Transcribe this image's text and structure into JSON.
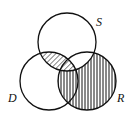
{
  "diagram": {
    "type": "venn",
    "sets": [
      {
        "id": "S",
        "label": "S",
        "cx": 67,
        "cy": 42,
        "r": 29,
        "label_x": 96,
        "label_y": 16
      },
      {
        "id": "D",
        "label": "D",
        "cx": 49,
        "cy": 81,
        "r": 29,
        "label_x": 8,
        "label_y": 92
      },
      {
        "id": "R",
        "label": "R",
        "cx": 87,
        "cy": 81,
        "r": 29,
        "label_x": 117,
        "label_y": 92
      }
    ],
    "shading": [
      {
        "region": "S ∩ D",
        "pattern": "diagonal-hatch"
      },
      {
        "region": "R − (S ∩ D)",
        "pattern": "vertical-hatch"
      }
    ],
    "colors": {
      "stroke": "#111111",
      "background": "#ffffff"
    }
  }
}
